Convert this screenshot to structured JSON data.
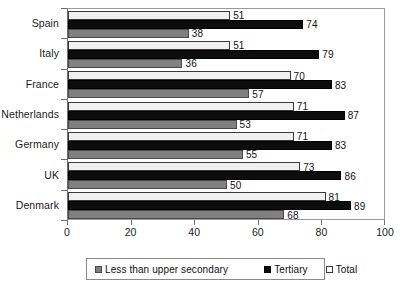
{
  "chart_data": {
    "type": "bar",
    "orientation": "horizontal",
    "title": "",
    "xlabel": "",
    "ylabel": "",
    "xlim": [
      0,
      100
    ],
    "xticks": [
      0,
      20,
      40,
      60,
      80,
      100
    ],
    "grid": false,
    "legend_position": "bottom",
    "categories": [
      "Spain",
      "Italy",
      "France",
      "Netherlands",
      "Germany",
      "UK",
      "Denmark"
    ],
    "series": [
      {
        "name": "Total",
        "color": "#f0f0f0",
        "values": [
          51,
          51,
          70,
          71,
          71,
          73,
          81
        ]
      },
      {
        "name": "Tertiary",
        "color": "#0d0d0d",
        "values": [
          74,
          79,
          83,
          87,
          83,
          86,
          89
        ]
      },
      {
        "name": "Less than upper secondary",
        "color": "#808080",
        "values": [
          38,
          36,
          57,
          53,
          55,
          50,
          68
        ]
      }
    ]
  },
  "axis": {
    "xtick_labels": [
      "0",
      "20",
      "40",
      "60",
      "80",
      "100"
    ],
    "category_labels": [
      "Spain",
      "Italy",
      "France",
      "Netherlands",
      "Germany",
      "UK",
      "Denmark"
    ]
  },
  "legend": {
    "items": [
      {
        "label": "Less than upper secondary",
        "swatch": "lower"
      },
      {
        "label": "Tertiary",
        "swatch": "tertiary"
      },
      {
        "label": "Total",
        "swatch": "total"
      }
    ]
  }
}
